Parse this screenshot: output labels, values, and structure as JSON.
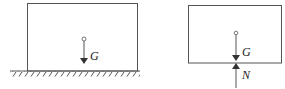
{
  "diagram": {
    "left_figure": {
      "force_label": "G",
      "has_ground": true
    },
    "right_figure": {
      "gravity_label": "G",
      "normal_label": "N",
      "has_ground": false
    },
    "colors": {
      "line": "#555555",
      "text": "#222222",
      "background": "#ffffff"
    }
  }
}
